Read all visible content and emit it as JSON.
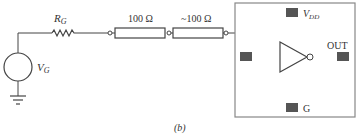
{
  "diagram": {
    "caption": "(b)",
    "source": {
      "label": "V",
      "label_sub": "G"
    },
    "generator_resistor": {
      "label": "R",
      "label_sub": "G"
    },
    "line_resistor_1": {
      "label": "100 Ω"
    },
    "line_resistor_2": {
      "label": "~100 Ω"
    },
    "chip": {
      "vdd_label": "V",
      "vdd_sub": "DD",
      "out_label": "OUT",
      "gnd_label": "G"
    },
    "colors": {
      "line": "#444444",
      "pad": "#555555",
      "box_border": "#888888"
    }
  }
}
